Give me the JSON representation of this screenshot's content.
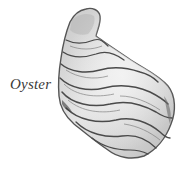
{
  "illustration": {
    "subject": "oyster-shell",
    "label": "Oyster",
    "colors": {
      "background": "#ffffff",
      "label_text": "#3a3a3a",
      "shell_light": "#e6e6e6",
      "shell_mid": "#bdbdbd",
      "shell_dark": "#5a5a5a",
      "ridge_lines": "#4a4a4a"
    }
  }
}
